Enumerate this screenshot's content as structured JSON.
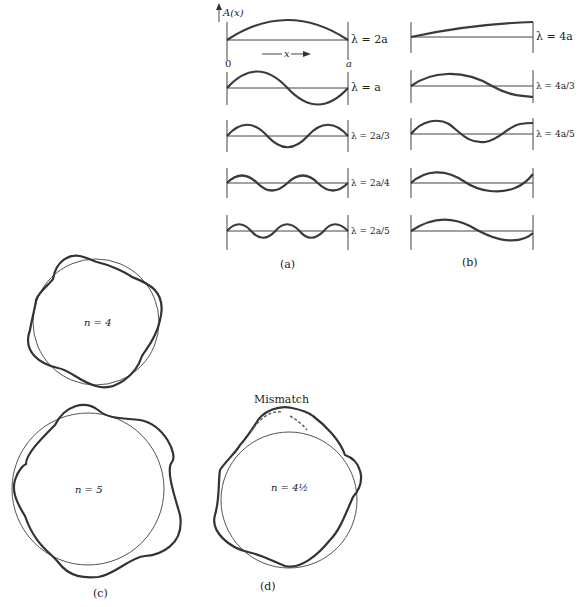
{
  "figure": {
    "panels": {
      "a": {
        "caption": "(a)",
        "axis_label": "A(x)",
        "origin_label": "0",
        "end_label": "a",
        "x_label": "x",
        "modes": [
          {
            "label": "λ = 2a",
            "half_waves": 1
          },
          {
            "label": "λ = a",
            "half_waves": 2
          },
          {
            "label": "λ = 2a/3",
            "half_waves": 3
          },
          {
            "label": "λ = 2a/4",
            "half_waves": 4
          },
          {
            "label": "λ = 2a/5",
            "half_waves": 5
          }
        ]
      },
      "b": {
        "caption": "(b)",
        "modes": [
          {
            "label": "λ = 4a",
            "quarter_waves": 1
          },
          {
            "label": "λ = 4a/3",
            "quarter_waves": 3
          },
          {
            "label": "λ = 4a/5",
            "quarter_waves": 5
          },
          {
            "label": "",
            "quarter_waves": 3
          },
          {
            "label": "",
            "quarter_waves": 3
          }
        ]
      },
      "c": {
        "caption": "(c)",
        "orbits": [
          {
            "label": "n = 4",
            "n": 4
          },
          {
            "label": "n = 5",
            "n": 5
          }
        ]
      },
      "d": {
        "caption": "(d)",
        "annotation": "Mismatch",
        "orbit": {
          "label": "n = 4½",
          "n": 4.5
        }
      }
    },
    "colors": {
      "wave": "#3a3a3a",
      "axis": "#444444",
      "background": "#ffffff"
    }
  }
}
